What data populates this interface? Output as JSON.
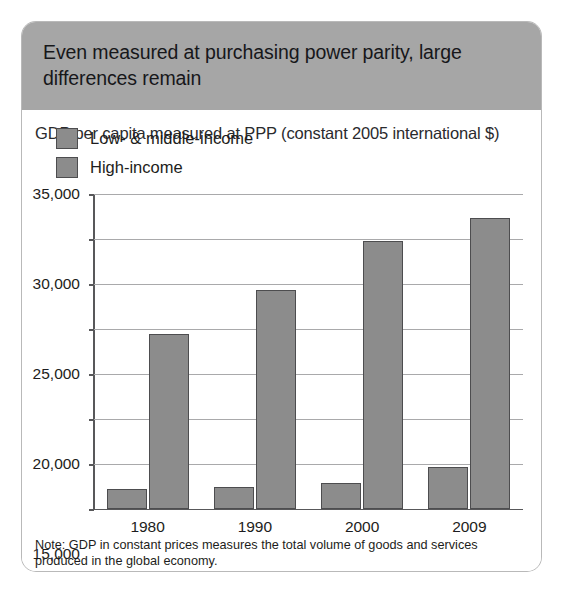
{
  "figure": {
    "title": "Even measured at purchasing power parity, large differences remain",
    "note": "Note: GDP in constant prices measures the total volume of goods and services produced in the global economy.",
    "source": "Source: World Bank, World Development Indicators database"
  },
  "colors": {
    "header_band": "#a6a6a6",
    "bar_fill": "#8c8c8c",
    "bar_stroke": "#4d4d4f",
    "gridline": "#a9a9ab",
    "axis": "#58585a",
    "text": "#1d1d20"
  },
  "chart_data": {
    "type": "bar",
    "title": "GDP per capita measured at PPP (constant 2005 international $)",
    "xlabel": "",
    "ylabel": "",
    "categories": [
      "1980",
      "1990",
      "2000",
      "2009"
    ],
    "series": [
      {
        "name": "Low- & middle-income",
        "values": [
          2200,
          2500,
          2900,
          4700
        ]
      },
      {
        "name": "High-income",
        "values": [
          19400,
          24300,
          29800,
          32300
        ]
      }
    ],
    "ylim": [
      0,
      35000
    ],
    "yticks": [
      0,
      5000,
      10000,
      15000,
      20000,
      25000,
      30000,
      35000
    ],
    "ytick_labels": [
      "0",
      "5,000",
      "10,000",
      "15,000",
      "20,000",
      "25,000",
      "30,000",
      "35,000"
    ],
    "grid": true,
    "legend_position": "top-left"
  }
}
